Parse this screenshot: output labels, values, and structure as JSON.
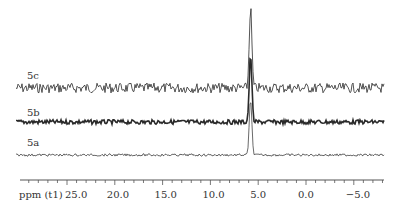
{
  "chart_data": {
    "type": "line",
    "title": "",
    "subtitle": "",
    "xlabel": "ppm (t1)",
    "ylabel": "",
    "xlim": [
      27.0,
      -8.0
    ],
    "x_reversed": true,
    "grid": false,
    "legend": "none",
    "x_ticks_major": [
      25.0,
      20.0,
      15.0,
      10.0,
      5.0,
      0.0,
      -5.0
    ],
    "x_tick_labels": [
      "25.0",
      "20.0",
      "15.0",
      "10.0",
      "5.0",
      "0.0",
      "−5.0"
    ],
    "minor_tick_step": 1.0,
    "series": [
      {
        "name": "5c",
        "baseline_y": 88,
        "noise": "high",
        "peak_ppm": 5.8,
        "peak_height_rel": 1.0
      },
      {
        "name": "5b",
        "baseline_y": 122,
        "noise": "medium",
        "peak_ppm": 5.8,
        "peak_height_rel": 0.6
      },
      {
        "name": "5a",
        "baseline_y": 155,
        "noise": "low",
        "peak_ppm": 5.8,
        "peak_height_rel": 0.4
      }
    ],
    "annotations": [
      "5c",
      "5b",
      "5a"
    ]
  },
  "labels": {
    "s5c": "5c",
    "s5b": "5b",
    "s5a": "5a",
    "axis": "ppm (t1)"
  },
  "colors": {
    "trace": "#2a2a2a",
    "axis": "#555555"
  }
}
